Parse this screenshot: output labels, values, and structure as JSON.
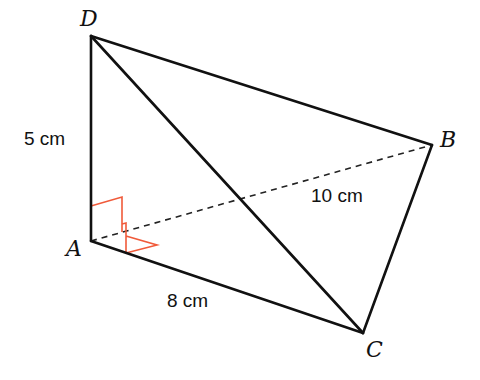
{
  "figure": {
    "type": "tetrahedron",
    "vertices": {
      "A": {
        "label": "A",
        "x": 91,
        "y": 241
      },
      "B": {
        "label": "B",
        "x": 432,
        "y": 145
      },
      "C": {
        "label": "C",
        "x": 363,
        "y": 333
      },
      "D": {
        "label": "D",
        "x": 91,
        "y": 36
      }
    },
    "edges": [
      {
        "from": "D",
        "to": "A",
        "style": "solid"
      },
      {
        "from": "D",
        "to": "B",
        "style": "solid"
      },
      {
        "from": "D",
        "to": "C",
        "style": "solid"
      },
      {
        "from": "A",
        "to": "C",
        "style": "solid"
      },
      {
        "from": "B",
        "to": "C",
        "style": "solid"
      },
      {
        "from": "A",
        "to": "B",
        "style": "dashed"
      }
    ],
    "lengths": {
      "AD": "5 cm",
      "AB": "10 cm",
      "AC": "8 cm"
    },
    "right_angles": [
      "DAB",
      "BAC"
    ],
    "colors": {
      "edge": "#111111",
      "right_angle_marker": "#f05a3a",
      "background": "#ffffff"
    }
  }
}
